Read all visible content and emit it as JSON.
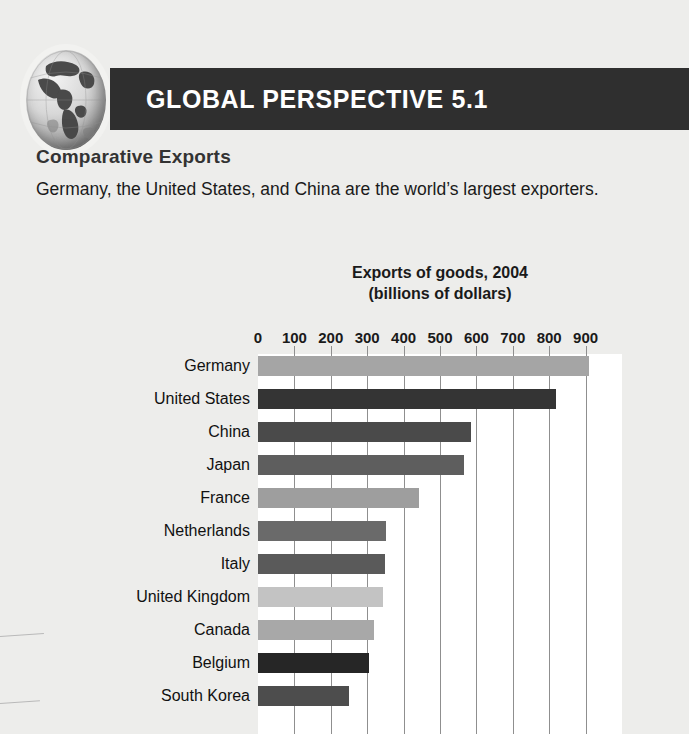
{
  "page": {
    "background_color": "#ededeb"
  },
  "banner": {
    "title": "GLOBAL PERSPECTIVE 5.1",
    "background_color": "#2f2f2f",
    "text_color": "#ffffff",
    "icon": "globe-icon"
  },
  "article": {
    "subhead": "Comparative Exports",
    "intro": "Germany, the United States, and China are the world’s largest exporters."
  },
  "chart_data": {
    "type": "bar",
    "orientation": "horizontal",
    "title": "Exports of goods, 2004\n(billions of dollars)",
    "title_line1": "Exports of goods, 2004",
    "title_line2": "(billions of dollars)",
    "xlabel": "",
    "ylabel": "",
    "xlim": [
      0,
      1000
    ],
    "tick_labels": [
      "0",
      "100",
      "200",
      "300",
      "400",
      "500",
      "600",
      "700",
      "800",
      "900"
    ],
    "ticks": [
      0,
      100,
      200,
      300,
      400,
      500,
      600,
      700,
      800,
      900
    ],
    "grid": "vertical",
    "legend": "none",
    "categories": [
      "Germany",
      "United States",
      "China",
      "Japan",
      "France",
      "Netherlands",
      "Italy",
      "United Kingdom",
      "Canada",
      "Belgium",
      "South Korea"
    ],
    "values": [
      910,
      820,
      585,
      565,
      443,
      352,
      350,
      343,
      320,
      305,
      250
    ],
    "bar_colors": [
      "#a5a5a5",
      "#343434",
      "#4a4a4a",
      "#5e5e5e",
      "#9e9e9e",
      "#6a6a6a",
      "#5a5a5a",
      "#c3c3c3",
      "#a8a8a8",
      "#262626",
      "#4d4d4d"
    ],
    "plot_background": "#ffffff",
    "gridline_color": "#8f8f8f"
  }
}
